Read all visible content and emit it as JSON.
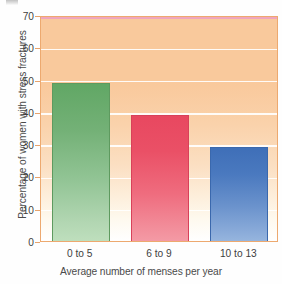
{
  "chart_data": {
    "type": "bar",
    "title": "",
    "categories": [
      "0 to 5",
      "6 to 9",
      "10 to 13"
    ],
    "values": [
      49,
      39,
      29
    ],
    "series": [
      {
        "name": "Percentage of women with stress fractures",
        "values": [
          49,
          39,
          29
        ]
      }
    ],
    "xlabel": "Average number of menses per year",
    "ylabel": "Percentage of women with stress fractures",
    "ylim": [
      0,
      70
    ],
    "yticks": [
      0,
      10,
      20,
      30,
      40,
      50,
      60,
      70
    ],
    "ytick_labels": [
      "0",
      "10",
      "20",
      "30",
      "40",
      "50",
      "60",
      "70"
    ],
    "grid": true,
    "grid_axis": "y",
    "legend": false,
    "legend_position": "none",
    "bar_colors": [
      "#74b177",
      "#ea5066",
      "#4a79bf"
    ],
    "bar_color_names": [
      "green",
      "red",
      "blue"
    ],
    "plot_background_top_color": "#f9c99c",
    "plot_background_bottom_color": "#ffffff",
    "plot_border_color": "#eda96f",
    "gridline_color": "#ffffff",
    "accent_top_line_color": "#f0a5bd"
  },
  "axes": {
    "y_title": "Percentage of women with stress fractures",
    "x_title": "Average number of menses per year",
    "y_ticks": [
      {
        "label": "70",
        "value": 70
      },
      {
        "label": "60",
        "value": 60
      },
      {
        "label": "50",
        "value": 50
      },
      {
        "label": "40",
        "value": 40
      },
      {
        "label": "30",
        "value": 30
      },
      {
        "label": "20",
        "value": 20
      },
      {
        "label": "10",
        "value": 10
      },
      {
        "label": "0",
        "value": 0
      }
    ],
    "x_ticks": [
      {
        "label": "0 to 5"
      },
      {
        "label": "6 to 9"
      },
      {
        "label": "10 to 13"
      }
    ]
  },
  "bars": [
    {
      "category": "0 to 5",
      "value": 49,
      "color": "green"
    },
    {
      "category": "6 to 9",
      "value": 39,
      "color": "red"
    },
    {
      "category": "10 to 13",
      "value": 29,
      "color": "blue"
    }
  ]
}
